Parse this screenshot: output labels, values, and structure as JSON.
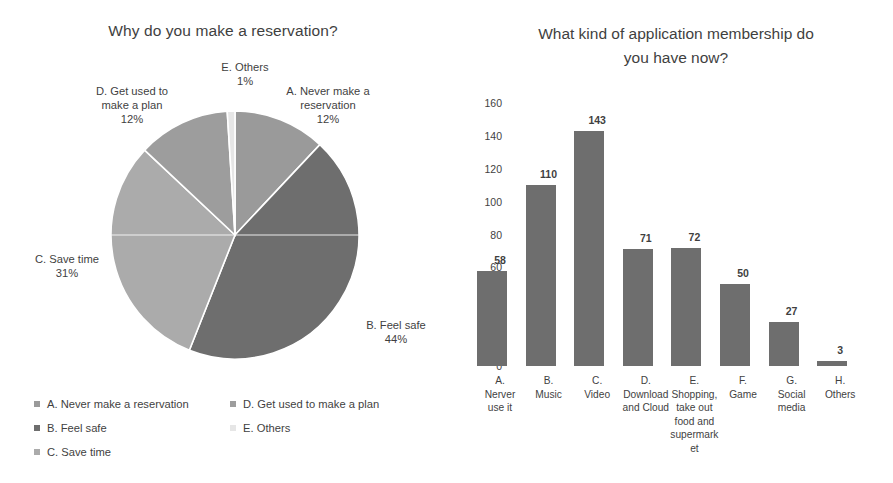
{
  "chart_data": [
    {
      "type": "pie",
      "title": "Why do you make a reservation?",
      "labels": [
        "A. Never make a reservation",
        "B. Feel safe",
        "C. Save time",
        "D. Get used to make a plan",
        "E. Others"
      ],
      "values": [
        12,
        44,
        31,
        12,
        1
      ],
      "value_suffix": "%",
      "colors": [
        "#9a9a9a",
        "#6e6e6e",
        "#ababab",
        "#9d9d9d",
        "#e6e6e6"
      ],
      "start_angle_deg": 0,
      "direction": "clockwise",
      "legend_position": "bottom",
      "grid": false,
      "callouts": [
        {
          "key": "A",
          "name": "A. Never make a",
          "name2": "reservation",
          "pct": "12%"
        },
        {
          "key": "B",
          "name": "B. Feel safe",
          "name2": "",
          "pct": "44%"
        },
        {
          "key": "C",
          "name": "C. Save time",
          "name2": "",
          "pct": "31%"
        },
        {
          "key": "D",
          "name": "D. Get used to",
          "name2": "make a plan",
          "pct": "12%"
        },
        {
          "key": "E",
          "name": "E. Others",
          "name2": "",
          "pct": "1%"
        }
      ]
    },
    {
      "type": "bar",
      "title_line1": "What kind of application membership do",
      "title_line2": "you have now?",
      "title": "What kind of application membership do you have now?",
      "categories": [
        "A. Nerver use it",
        "B. Music",
        "C. Video",
        "D. Download and Cloud",
        "E. Shopping, take out food and supermarket",
        "F. Game",
        "G. Social media",
        "H. Others"
      ],
      "category_lines": [
        [
          "A.",
          "Nerver",
          "use it"
        ],
        [
          "B.",
          "Music"
        ],
        [
          "C.",
          "Video"
        ],
        [
          "D.",
          "Download",
          "and Cloud"
        ],
        [
          "E.",
          "Shopping,",
          "take out",
          "food and",
          "supermark",
          "et"
        ],
        [
          "F.",
          "Game"
        ],
        [
          "G.",
          "Social",
          "media"
        ],
        [
          "H.",
          "Others"
        ]
      ],
      "values": [
        58,
        110,
        143,
        71,
        72,
        50,
        27,
        3
      ],
      "yticks": [
        160,
        140,
        120,
        100,
        80,
        60,
        40,
        20,
        0
      ],
      "ylim": [
        0,
        160
      ],
      "xlabel": "",
      "ylabel": "",
      "grid": false,
      "bar_color": "#6e6e6e"
    }
  ]
}
